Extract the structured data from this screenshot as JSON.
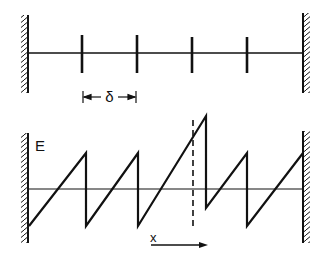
{
  "colors": {
    "ink": "#111111",
    "background": "#ffffff"
  },
  "top_diagram": {
    "name": "wire with periodic scatterers between fixed walls",
    "spacing_label": "δ",
    "tick_count": 4
  },
  "bottom_diagram": {
    "name": "sawtooth electric field profile",
    "field_label": "E",
    "position_label": "x",
    "dashed_marker": "vertical dashed line marking displaced step"
  }
}
